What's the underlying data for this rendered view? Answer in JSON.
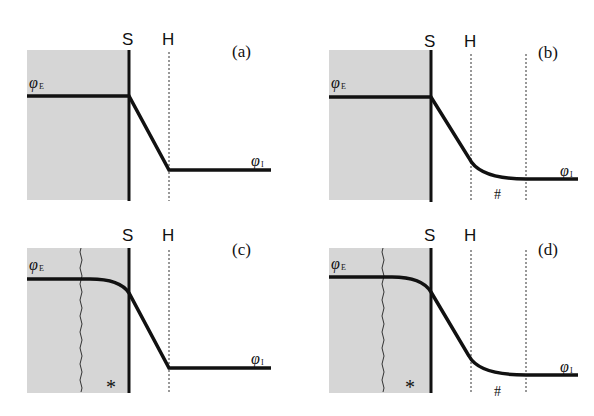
{
  "figure": {
    "colors": {
      "shade": "#d6d6d6",
      "line": "#111111",
      "background": "#ffffff"
    },
    "boundary_labels": {
      "s": "S",
      "h": "H"
    },
    "phi_left": {
      "symbol": "φ",
      "subscript": "E"
    },
    "phi_right": {
      "symbol": "φ",
      "subscript": "I"
    },
    "panels": [
      {
        "id": "a",
        "label": "(a)",
        "curved_left": false,
        "extended_right": false,
        "star": "",
        "hash": ""
      },
      {
        "id": "b",
        "label": "(b)",
        "curved_left": false,
        "extended_right": true,
        "star": "",
        "hash": "#"
      },
      {
        "id": "c",
        "label": "(c)",
        "curved_left": true,
        "extended_right": false,
        "star": "*",
        "hash": ""
      },
      {
        "id": "d",
        "label": "(d)",
        "curved_left": true,
        "extended_right": true,
        "star": "*",
        "hash": "#"
      }
    ]
  }
}
